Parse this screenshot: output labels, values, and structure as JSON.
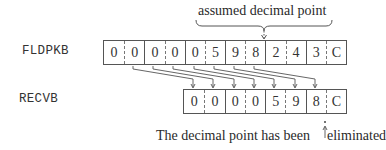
{
  "diagram": {
    "source_label": "FLDPKB",
    "target_label": "RECVB",
    "source_cells": [
      "0",
      "0",
      "0",
      "0",
      "0",
      "5",
      "9",
      "8",
      "2",
      "4",
      "3",
      "C"
    ],
    "target_cells": [
      "0",
      "0",
      "0",
      "0",
      "5",
      "9",
      "8",
      "C"
    ],
    "top_annotation": "assumed decimal point",
    "bottom_caption_before": "The decimal point has been",
    "bottom_caption_after": "eliminated",
    "arrow_map": [
      [
        1,
        0
      ],
      [
        2,
        1
      ],
      [
        3,
        2
      ],
      [
        4,
        3
      ],
      [
        5,
        4
      ],
      [
        6,
        5
      ],
      [
        7,
        6
      ]
    ],
    "colors": {
      "line": "#555555",
      "text": "#2a2a2a"
    }
  }
}
